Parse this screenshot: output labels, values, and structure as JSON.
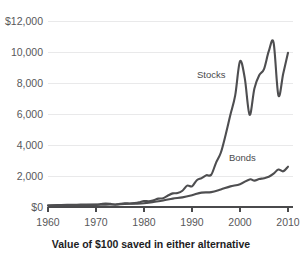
{
  "chart_data": {
    "type": "line",
    "title": "",
    "subtitle": "",
    "caption": "Value of $100 saved in either alternative",
    "xlabel": "",
    "ylabel": "",
    "xlim": [
      1960,
      2011
    ],
    "ylim": [
      0,
      12000
    ],
    "grid": true,
    "legend_position": "inline-annotation",
    "x_ticks": [
      1960,
      1970,
      1980,
      1990,
      2000,
      2010
    ],
    "x_tick_labels": [
      "1960",
      "1970",
      "1980",
      "1990",
      "2000",
      "2010"
    ],
    "y_ticks": [
      0,
      2000,
      4000,
      6000,
      8000,
      10000,
      12000
    ],
    "y_tick_labels": [
      "$0",
      "2,000",
      "4,000",
      "6,000",
      "8,000",
      "10,000",
      "$12,000"
    ],
    "annotations": [
      {
        "text": "Stocks",
        "x": 1994.0,
        "y": 8300
      },
      {
        "text": "Bonds",
        "x": 2000.5,
        "y": 2950
      }
    ],
    "series": [
      {
        "name": "Stocks",
        "color": "#4e4e50",
        "x": [
          1960,
          1962,
          1964,
          1966,
          1968,
          1970,
          1971,
          1972,
          1973,
          1974,
          1975,
          1976,
          1977,
          1978,
          1979,
          1980,
          1981,
          1982,
          1983,
          1984,
          1985,
          1986,
          1987,
          1988,
          1989,
          1990,
          1991,
          1992,
          1993,
          1994,
          1995,
          1996,
          1997,
          1998,
          1999,
          2000,
          2001,
          2002,
          2003,
          2004,
          2005,
          2006,
          2007,
          2008,
          2009,
          2010
        ],
        "values": [
          100,
          120,
          140,
          150,
          165,
          160,
          190,
          230,
          200,
          150,
          200,
          240,
          230,
          250,
          300,
          390,
          370,
          440,
          540,
          570,
          740,
          880,
          900,
          1050,
          1380,
          1330,
          1730,
          1860,
          2050,
          2080,
          2850,
          3500,
          4650,
          5950,
          7200,
          9400,
          8300,
          5950,
          7650,
          8500,
          8900,
          10050,
          10600,
          7200,
          8600,
          9950
        ]
      },
      {
        "name": "Bonds",
        "color": "#4e4e50",
        "x": [
          1960,
          1962,
          1964,
          1966,
          1968,
          1970,
          1972,
          1974,
          1976,
          1978,
          1980,
          1982,
          1984,
          1986,
          1988,
          1990,
          1992,
          1994,
          1996,
          1998,
          2000,
          2002,
          2003,
          2004,
          2005,
          2006,
          2007,
          2008,
          2009,
          2010
        ],
        "values": [
          100,
          105,
          112,
          118,
          122,
          135,
          155,
          165,
          200,
          215,
          240,
          330,
          420,
          540,
          620,
          760,
          930,
          960,
          1130,
          1330,
          1470,
          1780,
          1700,
          1800,
          1860,
          1950,
          2150,
          2420,
          2300,
          2600
        ]
      }
    ]
  },
  "figure": {
    "background_color": "#ffffff",
    "line_color": "#4e4e50",
    "grid_color": "#e9e9ea",
    "axis_color": "#4a4a4c",
    "tick_text_color": "#58585a",
    "caption_color": "#1d1d1f"
  }
}
